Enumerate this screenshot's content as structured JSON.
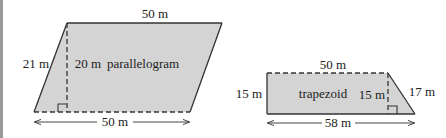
{
  "colors": {
    "shape_fill": "#d4d4d4",
    "stroke": "#333333",
    "border": "#9a9a9a"
  },
  "parallelogram": {
    "name": "parallelogram",
    "top_length": "50 m",
    "side_length": "21 m",
    "height": "20 m",
    "base_length": "50 m"
  },
  "trapezoid": {
    "name": "trapezoid",
    "top_length": "50 m",
    "left_side": "15 m",
    "height": "15 m",
    "slant_side": "17 m",
    "base_length": "58 m"
  }
}
